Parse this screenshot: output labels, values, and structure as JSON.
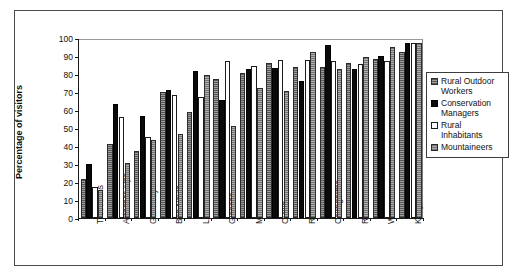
{
  "chart_data": {
    "type": "bar",
    "title": "",
    "xlabel": "",
    "ylabel": "Percentage of visitors",
    "ylim": [
      0,
      100
    ],
    "ytick_values": [
      0,
      10,
      20,
      30,
      40,
      50,
      60,
      70,
      80,
      90,
      100
    ],
    "ytick_labels": [
      "0",
      "10",
      "20",
      "30",
      "40",
      "50",
      "60",
      "70",
      "80",
      "90",
      "100"
    ],
    "grid": false,
    "legend_position": "right",
    "categories": [
      "Trossachs",
      "Arrochar Alps",
      "Galloway",
      "Ben Nevis",
      "Lewis",
      "Glencoe",
      "Monadhliath",
      "Cuillin",
      "Rum",
      "Cairngorms",
      "Rannoch Moor",
      "Wester Ross",
      "Knoydart"
    ],
    "series": [
      {
        "name": "Rural Outdoor Workers",
        "color": "#7c7c7c",
        "values": [
          21.5,
          41,
          37,
          70,
          59,
          77,
          80.5,
          86,
          84,
          84,
          86,
          88.5,
          92
        ]
      },
      {
        "name": "Conservation Managers",
        "color": "#0a0a0a",
        "values": [
          30,
          63.5,
          56.5,
          71,
          81.5,
          65.5,
          83,
          83.5,
          76,
          96,
          83,
          90,
          97.5
        ]
      },
      {
        "name": "Rural Inhabitants",
        "color": "#ffffff",
        "values": [
          17,
          56,
          45,
          68.5,
          67,
          87,
          84.5,
          88,
          88,
          87,
          85.5,
          87,
          97
        ]
      },
      {
        "name": "Mountaineers",
        "color": "#8e8e8e",
        "values": [
          15.5,
          30.5,
          43.5,
          46.5,
          79.5,
          51,
          72,
          70.5,
          92,
          83,
          89.5,
          95,
          97
        ]
      }
    ]
  },
  "legend": {
    "items": [
      {
        "label": "Rural Outdoor Workers",
        "swatch": "hatched-gray"
      },
      {
        "label": "Conservation Managers",
        "swatch": "solid-black"
      },
      {
        "label": "Rural Inhabitants",
        "swatch": "white-outline"
      },
      {
        "label": "Mountaineers",
        "swatch": "hatched-gray-light"
      }
    ]
  }
}
